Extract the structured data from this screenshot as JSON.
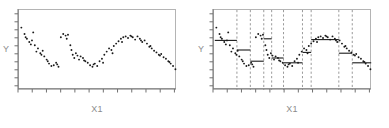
{
  "figure": {
    "background_color": "#ffffff",
    "frame_color": "#b4b4b4",
    "point_color": "#1a1a1a",
    "fit_color": "#1a1a1a",
    "changepoint_color": "#808080",
    "label_color": "#8c8c8c",
    "panel_count": 2
  },
  "panels": [
    {
      "name": "scatter-panel",
      "ylabel": "Y",
      "xlabel": "X1"
    },
    {
      "name": "segmented-fit-panel",
      "ylabel": "Y",
      "xlabel": "X1"
    }
  ],
  "chart_data": [
    {
      "type": "scatter",
      "title": "",
      "xlabel": "X1",
      "ylabel": "Y",
      "xlim": [
        0,
        100
      ],
      "ylim": [
        0,
        100
      ],
      "grid": false,
      "legend": "none",
      "xticks": [
        0,
        9,
        18,
        27,
        36,
        45,
        54,
        63,
        72,
        81,
        90,
        99
      ],
      "yticks": [
        4,
        14,
        24,
        34,
        44,
        54,
        64,
        74,
        84,
        94
      ],
      "x": [
        1.5,
        3.5,
        5.0,
        6.5,
        7.5,
        9.0,
        10.0,
        11.0,
        12.0,
        13.5,
        15.0,
        16.0,
        17.5,
        19.0,
        20.5,
        22.0,
        23.5,
        25.0,
        26.5,
        28.0,
        29.5,
        31.0,
        32.5,
        34.0,
        35.0,
        36.0,
        37.0,
        38.0,
        39.0,
        40.5,
        42.0,
        43.5,
        45.0,
        46.5,
        48.0,
        49.5,
        51.0,
        52.5,
        54.0,
        55.5,
        57.0,
        58.5,
        60.0,
        61.5,
        63.0,
        64.5,
        66.0,
        67.5,
        69.0,
        70.5,
        72.0,
        73.5,
        75.0,
        76.5,
        78.0,
        79.5,
        81.0,
        82.5,
        84.0,
        85.5,
        87.0,
        88.5,
        90.0,
        91.5,
        93.0,
        94.5,
        96.0,
        97.5,
        99.0,
        4.2,
        8.2,
        14.2,
        18.2,
        24.2,
        30.2,
        33.2,
        41.2,
        47.2,
        53.2,
        59.2,
        65.2,
        71.2,
        77.2,
        83.2,
        89.2,
        95.2
      ],
      "y": [
        78,
        70,
        64,
        60,
        57,
        72,
        56,
        48,
        52,
        46,
        49,
        42,
        38,
        33,
        30,
        31,
        34,
        29,
        66,
        70,
        68,
        69,
        56,
        44,
        40,
        46,
        43,
        38,
        42,
        40,
        36,
        34,
        31,
        29,
        33,
        30,
        36,
        39,
        44,
        48,
        52,
        50,
        55,
        58,
        61,
        64,
        66,
        67,
        65,
        68,
        66,
        63,
        67,
        64,
        60,
        62,
        58,
        54,
        52,
        49,
        47,
        44,
        45,
        41,
        39,
        36,
        33,
        30,
        26,
        66,
        62,
        44,
        36,
        32,
        64,
        50,
        37,
        32,
        34,
        46,
        60,
        67,
        62,
        55,
        43,
        35
      ]
    },
    {
      "type": "scatter",
      "title": "",
      "xlabel": "X1",
      "ylabel": "Y",
      "xlim": [
        0,
        100
      ],
      "ylim": [
        0,
        100
      ],
      "grid": false,
      "legend": "none",
      "xticks": [
        0,
        9,
        18,
        27,
        36,
        45,
        54,
        63,
        72,
        81,
        90,
        99
      ],
      "yticks": [
        4,
        14,
        24,
        34,
        44,
        54,
        64,
        74,
        84,
        94
      ],
      "changepoints": [
        14.5,
        23.0,
        31.5,
        36.5,
        44.0,
        56.0,
        61.5,
        79.0,
        87.5
      ],
      "fit_segments": [
        {
          "x0": 0.5,
          "x1": 14.5,
          "level": 62
        },
        {
          "x0": 14.5,
          "x1": 23.0,
          "level": 50
        },
        {
          "x0": 23.0,
          "x1": 31.5,
          "level": 36
        },
        {
          "x0": 31.5,
          "x1": 36.5,
          "level": 64
        },
        {
          "x0": 36.5,
          "x1": 44.0,
          "level": 40
        },
        {
          "x0": 44.0,
          "x1": 56.0,
          "level": 34
        },
        {
          "x0": 56.0,
          "x1": 61.5,
          "level": 47
        },
        {
          "x0": 61.5,
          "x1": 79.0,
          "level": 63
        },
        {
          "x0": 79.0,
          "x1": 87.5,
          "level": 46
        },
        {
          "x0": 87.5,
          "x1": 99.5,
          "level": 34
        }
      ],
      "x": [
        1.5,
        3.5,
        5.0,
        6.5,
        7.5,
        9.0,
        10.0,
        11.0,
        12.0,
        13.5,
        15.0,
        16.0,
        17.5,
        19.0,
        20.5,
        22.0,
        23.5,
        25.0,
        26.5,
        28.0,
        29.5,
        31.0,
        32.5,
        34.0,
        35.0,
        36.0,
        37.0,
        38.0,
        39.0,
        40.5,
        42.0,
        43.5,
        45.0,
        46.5,
        48.0,
        49.5,
        51.0,
        52.5,
        54.0,
        55.5,
        57.0,
        58.5,
        60.0,
        61.5,
        63.0,
        64.5,
        66.0,
        67.5,
        69.0,
        70.5,
        72.0,
        73.5,
        75.0,
        76.5,
        78.0,
        79.5,
        81.0,
        82.5,
        84.0,
        85.5,
        87.0,
        88.5,
        90.0,
        91.5,
        93.0,
        94.5,
        96.0,
        97.5,
        99.0,
        4.2,
        8.2,
        14.2,
        18.2,
        24.2,
        30.2,
        33.2,
        41.2,
        47.2,
        53.2,
        59.2,
        65.2,
        71.2,
        77.2,
        83.2,
        89.2,
        95.2
      ],
      "y": [
        78,
        70,
        64,
        60,
        57,
        72,
        56,
        48,
        52,
        46,
        49,
        42,
        38,
        33,
        30,
        31,
        34,
        29,
        66,
        70,
        68,
        69,
        56,
        44,
        40,
        46,
        43,
        38,
        42,
        40,
        36,
        34,
        31,
        29,
        33,
        30,
        36,
        39,
        44,
        48,
        52,
        50,
        55,
        58,
        61,
        64,
        66,
        67,
        65,
        68,
        66,
        63,
        67,
        64,
        60,
        62,
        58,
        54,
        52,
        49,
        47,
        44,
        45,
        41,
        39,
        36,
        33,
        30,
        26,
        66,
        62,
        44,
        36,
        32,
        64,
        50,
        37,
        32,
        34,
        46,
        60,
        67,
        62,
        55,
        43,
        35
      ]
    }
  ]
}
